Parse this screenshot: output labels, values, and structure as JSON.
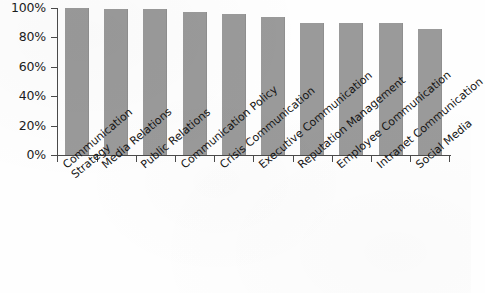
{
  "chart_data": {
    "type": "bar",
    "title": "",
    "xlabel": "",
    "ylabel": "",
    "ylim": [
      0,
      100
    ],
    "grid": false,
    "legend": null,
    "bar_color": "#9a9a9a",
    "axis_color": "#4a4a4a",
    "ytick_labels": [
      "100%",
      "80%",
      "60%",
      "40%",
      "20%",
      "0%"
    ],
    "ytick_values": [
      100,
      80,
      60,
      40,
      20,
      0
    ],
    "categories": [
      "Communication\nStrategy",
      "Media Relations",
      "Public Relations",
      "Communication Policy",
      "Crisis Communication",
      "Executive Communication",
      "Reputation Management",
      "Employee Communication",
      "Intranet Communication",
      "Social Media"
    ],
    "values": [
      100,
      99,
      99,
      97,
      96,
      94,
      90,
      90,
      90,
      86
    ]
  }
}
